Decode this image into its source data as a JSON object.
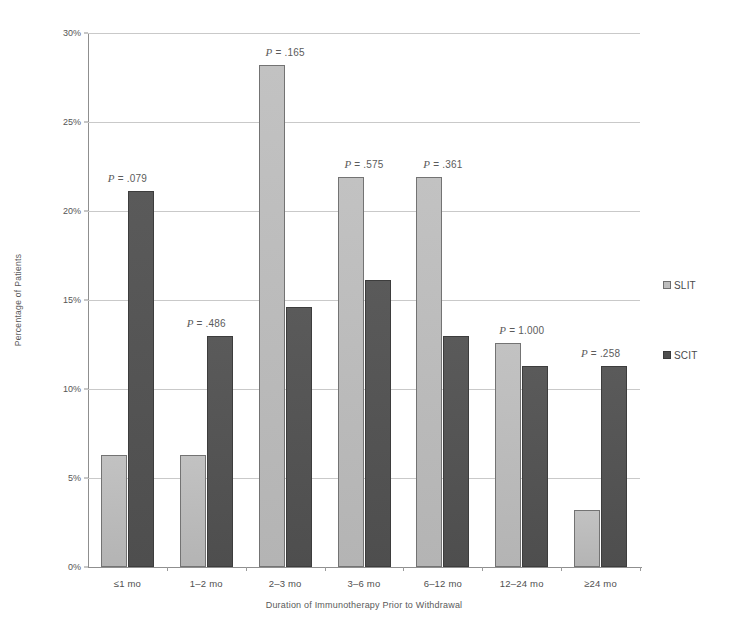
{
  "chart_data": {
    "type": "bar",
    "title": "",
    "xlabel": "Duration of Immunotherapy Prior to Withdrawal",
    "ylabel": "Percentage of Patients",
    "categories": [
      "≤1 mo",
      "1–2 mo",
      "2–3 mo",
      "3–6 mo",
      "6–12 mo",
      "12–24 mo",
      "≥24 mo"
    ],
    "series": [
      {
        "name": "SLIT",
        "color": "#bdbdbd",
        "values": [
          6.3,
          6.3,
          28.2,
          21.9,
          21.9,
          12.6,
          3.2
        ]
      },
      {
        "name": "SCIT",
        "color": "#4f4f4f",
        "values": [
          21.1,
          13.0,
          14.6,
          16.1,
          13.0,
          11.3,
          11.3
        ]
      }
    ],
    "annotations": [
      {
        "text": "P = .079",
        "p_label": "P",
        "p_value": "= .079",
        "category": "≤1 mo"
      },
      {
        "text": "P = .486",
        "p_label": "P",
        "p_value": "= .486",
        "category": "1–2 mo"
      },
      {
        "text": "P = .165",
        "p_label": "P",
        "p_value": "= .165",
        "category": "2–3 mo"
      },
      {
        "text": "P = .575",
        "p_label": "P",
        "p_value": "= .575",
        "category": "3–6 mo"
      },
      {
        "text": "P = .361",
        "p_label": "P",
        "p_value": "= .361",
        "category": "6–12 mo"
      },
      {
        "text": "P = 1.000",
        "p_label": "P",
        "p_value": "= 1.000",
        "category": "12–24 mo"
      },
      {
        "text": "P = .258",
        "p_label": "P",
        "p_value": "= .258",
        "category": "≥24 mo"
      }
    ],
    "ylim": [
      0,
      30
    ],
    "ytick_labels": [
      "0%",
      "5%",
      "10%",
      "15%",
      "20%",
      "25%",
      "30%"
    ],
    "ytick_values": [
      0,
      5,
      10,
      15,
      20,
      25,
      30
    ],
    "grid": true,
    "legend_position": "right"
  },
  "legend": {
    "items": [
      {
        "label": "SLIT",
        "swatch": "slit"
      },
      {
        "label": "SCIT",
        "swatch": "scit"
      }
    ]
  }
}
